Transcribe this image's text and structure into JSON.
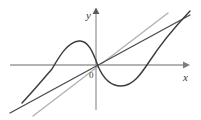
{
  "figure": {
    "background_color": "#ffffff",
    "width": 201,
    "height": 120,
    "axis_color": "#9a9a9a",
    "curve_color": "#3c3c3c",
    "line_dark_color": "#4a4a4a",
    "line_light_color": "#b0b0b0",
    "label_color": "#3a3a3a"
  },
  "labels": {
    "y_axis": "y",
    "x_axis": "x",
    "origin": "0"
  },
  "chart_data": {
    "type": "line",
    "title": "",
    "xlabel": "x",
    "ylabel": "y",
    "grid": false,
    "legend": "none",
    "axes": {
      "origin_px": [
        96,
        65
      ],
      "x_axis_px": {
        "x1": 10,
        "y1": 65,
        "x2": 186,
        "y2": 65,
        "arrow": "right"
      },
      "y_axis_px": {
        "x1": 96,
        "y1": 110,
        "x2": 96,
        "y2": 10,
        "arrow": "up"
      }
    },
    "xlim": [
      -4.3,
      4.5
    ],
    "ylim": [
      -2.8,
      2.8
    ],
    "series": [
      {
        "name": "cubic-curve",
        "type": "curve",
        "color": "#3c3c3c",
        "description": "S-shaped cubic through the origin with local maximum left of origin and local minimum right of origin",
        "points_px": [
          [
            22,
            103
          ],
          [
            32,
            94
          ],
          [
            42,
            83
          ],
          [
            50,
            72
          ],
          [
            58,
            60
          ],
          [
            66,
            49
          ],
          [
            74,
            42
          ],
          [
            82,
            41
          ],
          [
            89,
            46
          ],
          [
            94,
            56
          ],
          [
            98,
            66
          ],
          [
            104,
            76
          ],
          [
            111,
            83
          ],
          [
            120,
            86
          ],
          [
            129,
            84
          ],
          [
            138,
            77
          ],
          [
            146,
            67
          ],
          [
            154,
            55
          ],
          [
            162,
            44
          ],
          [
            172,
            31
          ],
          [
            182,
            19
          ],
          [
            190,
            11
          ]
        ],
        "local_max_px": [
          79,
          41
        ],
        "local_min_px": [
          122,
          86
        ],
        "root_px": [
          96,
          65
        ]
      },
      {
        "name": "tangent-line-dark",
        "type": "line",
        "color": "#4a4a4a",
        "description": "Dark straight line of same slope passing through the origin region, drawn from lower-left to upper-right",
        "start_px": [
          10,
          113
        ],
        "end_px": [
          190,
          15
        ]
      },
      {
        "name": "parallel-line-light",
        "type": "line",
        "color": "#b0b0b0",
        "description": "Lighter gray line parallel to the dark line, offset down and to the right",
        "start_px": [
          33,
          116
        ],
        "end_px": [
          168,
          13
        ]
      }
    ],
    "annotations": [
      {
        "name": "y-axis-label",
        "text": "y",
        "px": [
          89,
          16
        ],
        "italic": true
      },
      {
        "name": "x-axis-label",
        "text": "x",
        "px": [
          186,
          78
        ],
        "italic": true
      },
      {
        "name": "origin-label",
        "text": "0",
        "px": [
          92,
          76
        ],
        "italic": false
      }
    ]
  }
}
